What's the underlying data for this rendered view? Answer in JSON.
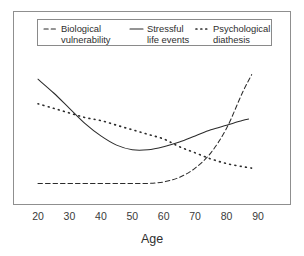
{
  "chart_data": {
    "type": "line",
    "title": "",
    "xlabel": "Age",
    "ylabel": "",
    "xlim": [
      15,
      95
    ],
    "ylim": [
      0,
      100
    ],
    "xticks": [
      20,
      30,
      40,
      50,
      60,
      70,
      80,
      90
    ],
    "xtick_labels": [
      "20",
      "30",
      "40",
      "50",
      "60",
      "70",
      "80",
      "90"
    ],
    "yticks": [],
    "ytick_labels": [],
    "grid": false,
    "legend_position": "top",
    "frame": true,
    "series": [
      {
        "name": "Biological vulnerability",
        "style": "dashed",
        "color": "#2b2b2b",
        "x": [
          20,
          25,
          30,
          35,
          40,
          45,
          50,
          55,
          60,
          65,
          70,
          75,
          80,
          85,
          88
        ],
        "values": [
          21,
          21,
          21,
          21,
          21,
          21,
          21,
          21,
          22,
          25,
          31,
          41,
          57,
          80,
          92
        ]
      },
      {
        "name": "Stressful life events",
        "style": "solid",
        "color": "#2b2b2b",
        "x": [
          20,
          25,
          30,
          35,
          40,
          45,
          50,
          55,
          60,
          65,
          70,
          75,
          80,
          85,
          87
        ],
        "values": [
          89,
          80,
          70,
          60,
          52,
          46,
          43,
          43,
          45,
          48,
          52,
          56,
          59,
          62,
          63
        ]
      },
      {
        "name": "Psychological diathesis",
        "style": "dotted",
        "color": "#2b2b2b",
        "x": [
          20,
          25,
          30,
          35,
          40,
          45,
          50,
          55,
          60,
          65,
          70,
          75,
          80,
          85,
          88
        ],
        "values": [
          73,
          70,
          67,
          64,
          62,
          59,
          56,
          53,
          50,
          45,
          41,
          37,
          34,
          32,
          31
        ]
      }
    ],
    "legend_entries": [
      {
        "label_line1": "Biological",
        "label_line2": "vulnerability",
        "style": "dashed"
      },
      {
        "label_line1": "Stressful",
        "label_line2": "life events",
        "style": "solid"
      },
      {
        "label_line1": "Psychological",
        "label_line2": "diathesis",
        "style": "dotted"
      }
    ]
  }
}
